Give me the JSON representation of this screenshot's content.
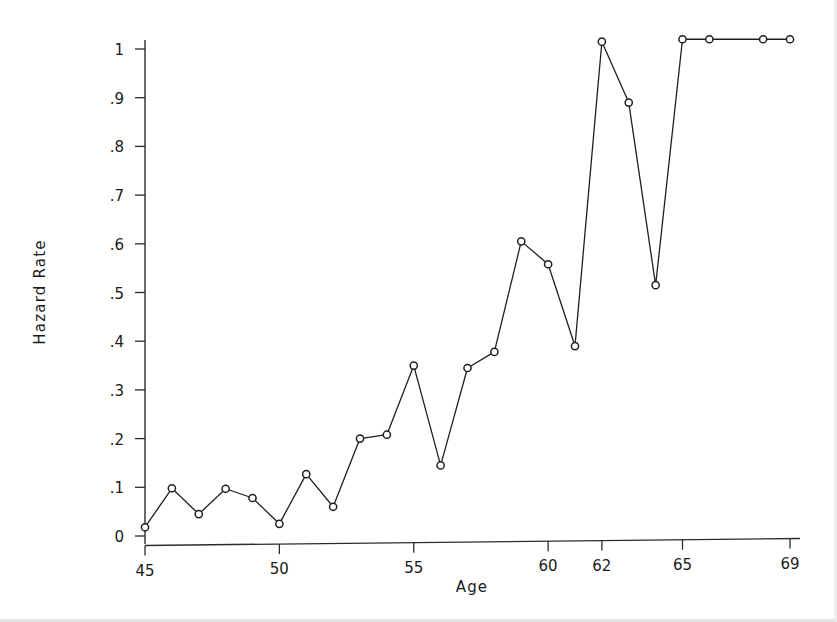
{
  "chart_data": {
    "type": "line",
    "title": "",
    "subtitle": "",
    "xlabel": "Age",
    "ylabel": "Hazard Rate",
    "xlim": [
      44.2,
      69.8
    ],
    "ylim": [
      0,
      1.06
    ],
    "xticks": [
      45,
      50,
      55,
      60,
      62,
      65,
      69
    ],
    "xtick_labels": [
      "45",
      "50",
      "55",
      "60",
      "62",
      "65",
      "69"
    ],
    "yticks": [
      0,
      0.1,
      0.2,
      0.3,
      0.4,
      0.5,
      0.6,
      0.7,
      0.8,
      0.9,
      1
    ],
    "ytick_labels": [
      "0",
      ".1",
      ".2",
      ".3",
      ".4",
      ".5",
      ".6",
      ".7",
      ".8",
      ".9",
      "1"
    ],
    "grid": false,
    "legend": false,
    "legend_position": "none",
    "marker": "open-circle",
    "line_color": "#1a1a1a",
    "marker_color": "#1a1a1a",
    "background_color": "#ffffff",
    "x": [
      45,
      46,
      47,
      48,
      49,
      50,
      51,
      52,
      53,
      54,
      55,
      56,
      57,
      58,
      59,
      60,
      61,
      62,
      63,
      64,
      65,
      66,
      68,
      69
    ],
    "values": [
      0.018,
      0.098,
      0.045,
      0.097,
      0.078,
      0.025,
      0.127,
      0.06,
      0.2,
      0.208,
      0.35,
      0.145,
      0.345,
      0.378,
      0.605,
      0.558,
      0.39,
      1.015,
      0.89,
      0.515,
      1.02,
      1.02,
      1.02,
      1.02
    ],
    "series": [
      {
        "name": "Hazard Rate",
        "x": [
          45,
          46,
          47,
          48,
          49,
          50,
          51,
          52,
          53,
          54,
          55,
          56,
          57,
          58,
          59,
          60,
          61,
          62,
          63,
          64,
          65,
          66,
          68,
          69
        ],
        "values": [
          0.018,
          0.098,
          0.045,
          0.097,
          0.078,
          0.025,
          0.127,
          0.06,
          0.2,
          0.208,
          0.35,
          0.145,
          0.345,
          0.378,
          0.605,
          0.558,
          0.39,
          1.015,
          0.89,
          0.515,
          1.02,
          1.02,
          1.02,
          1.02
        ]
      }
    ]
  }
}
